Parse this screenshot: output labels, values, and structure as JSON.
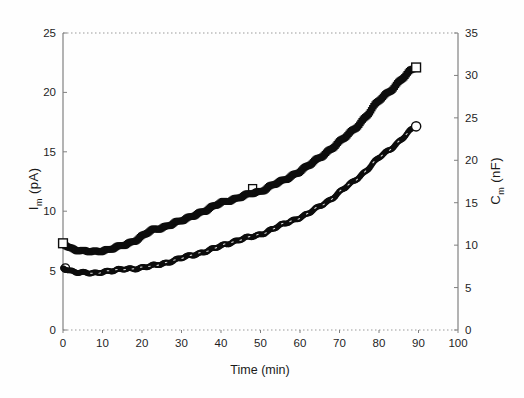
{
  "page": {
    "background": "#fefefe"
  },
  "chart_data": {
    "type": "scatter",
    "title": "",
    "xlabel": "Time (min)",
    "xlim": [
      0,
      100
    ],
    "x_ticks": [
      0,
      10,
      20,
      30,
      40,
      50,
      60,
      70,
      80,
      90,
      100
    ],
    "grid": "off",
    "border_top_style": "dotted",
    "x_axis_style": "dotted",
    "left_axis": {
      "label_symbol": "I",
      "label_sub": "m",
      "label_unit": " (pA)",
      "lim": [
        0,
        25
      ],
      "ticks": [
        0,
        5,
        10,
        15,
        20,
        25
      ]
    },
    "right_axis": {
      "label_symbol": "C",
      "label_sub": "m",
      "label_unit": " (nF)",
      "lim": [
        0,
        35
      ],
      "ticks": [
        0,
        5,
        10,
        15,
        20,
        25,
        30,
        35
      ]
    },
    "series": [
      {
        "name": "membrane-current",
        "axis": "left",
        "marker": "filled-square",
        "marker_color": "#0d0d0d",
        "keypoints": [
          [
            0,
            7.3
          ],
          [
            2,
            6.9
          ],
          [
            4,
            6.7
          ],
          [
            6,
            6.6
          ],
          [
            8,
            6.6
          ],
          [
            10,
            6.7
          ],
          [
            13,
            6.9
          ],
          [
            16,
            7.2
          ],
          [
            19,
            7.7
          ],
          [
            22,
            8.3
          ],
          [
            25,
            8.6
          ],
          [
            28,
            9.0
          ],
          [
            31,
            9.3
          ],
          [
            34,
            9.8
          ],
          [
            37,
            10.2
          ],
          [
            40,
            10.7
          ],
          [
            43,
            11.0
          ],
          [
            46,
            11.3
          ],
          [
            48,
            11.5
          ],
          [
            50,
            11.7
          ],
          [
            53,
            12.2
          ],
          [
            56,
            12.6
          ],
          [
            59,
            13.2
          ],
          [
            62,
            13.8
          ],
          [
            65,
            14.5
          ],
          [
            68,
            15.3
          ],
          [
            71,
            16.1
          ],
          [
            74,
            17.0
          ],
          [
            77,
            18.1
          ],
          [
            80,
            19.3
          ],
          [
            83,
            20.2
          ],
          [
            86,
            21.2
          ],
          [
            89.4,
            22.1
          ]
        ],
        "open_markers_front": [
          [
            0,
            7.3
          ],
          [
            89.4,
            22.1
          ]
        ],
        "open_markers_behind": [
          [
            48,
            11.9
          ]
        ],
        "white_dashes": [
          [
            81.8,
            19.1
          ]
        ]
      },
      {
        "name": "membrane-capacitance",
        "axis": "right",
        "marker": "filled-circle",
        "marker_color": "#0d0d0d",
        "keypoints": [
          [
            0,
            7.3
          ],
          [
            2,
            7.0
          ],
          [
            4,
            6.8
          ],
          [
            6,
            6.7
          ],
          [
            8,
            6.7
          ],
          [
            10,
            6.9
          ],
          [
            13,
            7.0
          ],
          [
            16,
            7.2
          ],
          [
            19,
            7.3
          ],
          [
            22,
            7.5
          ],
          [
            25,
            7.8
          ],
          [
            28,
            8.2
          ],
          [
            31,
            8.6
          ],
          [
            34,
            9.0
          ],
          [
            37,
            9.4
          ],
          [
            40,
            9.9
          ],
          [
            43,
            10.4
          ],
          [
            46,
            10.8
          ],
          [
            48,
            11.0
          ],
          [
            50,
            11.3
          ],
          [
            53,
            11.9
          ],
          [
            56,
            12.5
          ],
          [
            59,
            13.1
          ],
          [
            62,
            13.7
          ],
          [
            65,
            14.6
          ],
          [
            68,
            15.5
          ],
          [
            71,
            16.6
          ],
          [
            74,
            17.7
          ],
          [
            77,
            18.9
          ],
          [
            80,
            20.3
          ],
          [
            83,
            21.4
          ],
          [
            86,
            22.6
          ],
          [
            89.4,
            24.0
          ]
        ],
        "open_markers_front": [
          [
            89.4,
            24.0
          ]
        ],
        "open_markers_behind": [
          [
            0.6,
            7.3
          ]
        ],
        "white_dashes": []
      }
    ],
    "colors": {
      "marker": "#0d0d0d",
      "axis_line": "#808080",
      "dotted_line": "#9a9a9a",
      "tick_text": "#1f1f1f"
    }
  }
}
